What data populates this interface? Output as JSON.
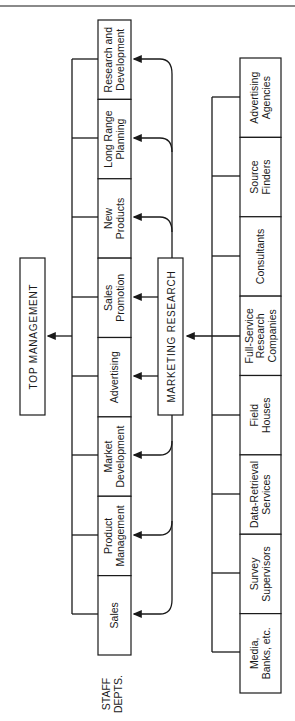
{
  "title_top": "TOP MANAGEMENT",
  "center_node": "MARKETING RESEARCH",
  "staff_label": [
    "STAFF",
    "DEPTS."
  ],
  "staff_depts": [
    {
      "lines": [
        "Research and",
        "Development"
      ]
    },
    {
      "lines": [
        "Long Range",
        "Planning"
      ]
    },
    {
      "lines": [
        "New",
        "Products"
      ]
    },
    {
      "lines": [
        "Sales",
        "Promotion"
      ]
    },
    {
      "lines": [
        "Advertising"
      ]
    },
    {
      "lines": [
        "Market",
        "Development"
      ]
    },
    {
      "lines": [
        "Product",
        "Management"
      ]
    },
    {
      "lines": [
        "Sales"
      ]
    }
  ],
  "external_sources": [
    {
      "lines": [
        "Advertising",
        "Agencies"
      ]
    },
    {
      "lines": [
        "Source",
        "Finders"
      ]
    },
    {
      "lines": [
        "Consultants"
      ]
    },
    {
      "lines": [
        "Full-Service",
        "Research",
        "Companies"
      ]
    },
    {
      "lines": [
        "Field",
        "Houses"
      ]
    },
    {
      "lines": [
        "Data-Retrieval",
        "Services"
      ]
    },
    {
      "lines": [
        "Survey",
        "Supervisors"
      ]
    },
    {
      "lines": [
        "Media,",
        "Banks, etc."
      ]
    }
  ],
  "colors": {
    "ink": "#1a1a1a",
    "background": "#ffffff"
  }
}
